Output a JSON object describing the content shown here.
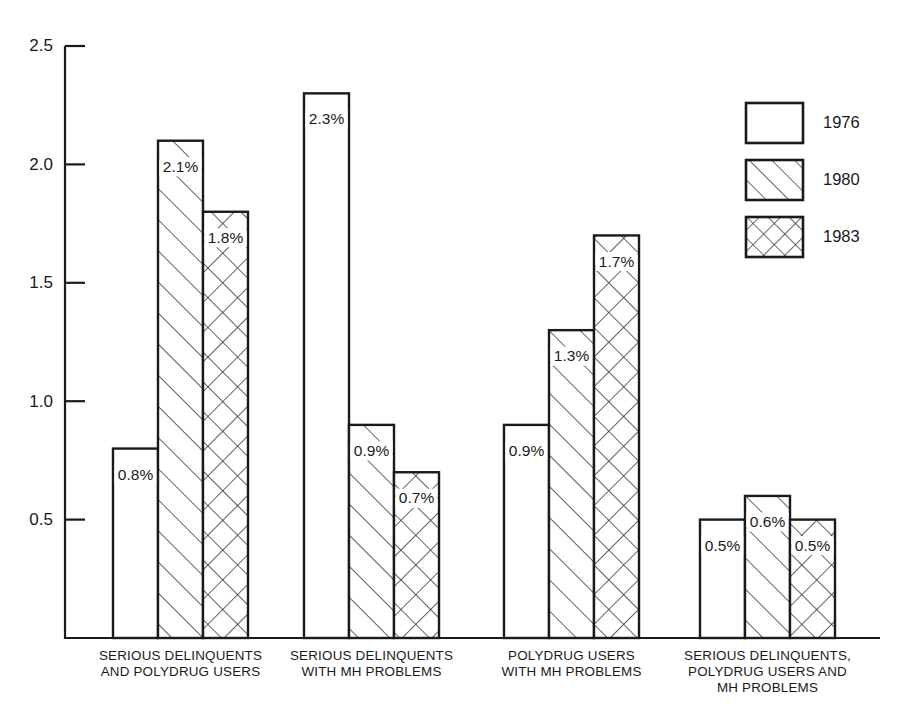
{
  "chart_data": {
    "type": "bar",
    "title": "",
    "subtitle": "",
    "xlabel": "",
    "ylabel": "",
    "ylim": [
      0,
      2.5
    ],
    "grid": false,
    "legend_position": "top-right",
    "y_ticks": [
      "0.5",
      "1.0",
      "1.5",
      "2.0",
      "2.5"
    ],
    "y_tick_values": [
      0.5,
      1.0,
      1.5,
      2.0,
      2.5
    ],
    "categories": [
      "SERIOUS DELINQUENTS AND POLYDRUG USERS",
      "SERIOUS DELINQUENTS WITH MH PROBLEMS",
      "POLYDRUG USERS WITH MH PROBLEMS",
      "SERIOUS DELINQUENTS, POLYDRUG USERS AND MH PROBLEMS"
    ],
    "category_lines": [
      [
        "SERIOUS DELINQUENTS",
        "AND POLYDRUG USERS"
      ],
      [
        "SERIOUS DELINQUENTS",
        "WITH MH PROBLEMS"
      ],
      [
        "POLYDRUG USERS",
        "WITH MH PROBLEMS"
      ],
      [
        "SERIOUS DELINQUENTS,",
        "POLYDRUG USERS AND",
        "MH PROBLEMS"
      ]
    ],
    "series": [
      {
        "name": "1976",
        "pattern": "plain",
        "values": [
          0.8,
          2.3,
          0.9,
          0.5
        ],
        "labels": [
          "0.8%",
          "2.3%",
          "0.9%",
          "0.5%"
        ]
      },
      {
        "name": "1980",
        "pattern": "diagonal",
        "values": [
          2.1,
          0.9,
          1.3,
          0.6
        ],
        "labels": [
          "2.1%",
          "0.9%",
          "1.3%",
          "0.6%"
        ]
      },
      {
        "name": "1983",
        "pattern": "crosshatch",
        "values": [
          1.8,
          0.7,
          1.7,
          0.5
        ],
        "labels": [
          "1.8%",
          "0.7%",
          "1.7%",
          "0.5%"
        ]
      }
    ]
  },
  "legend": {
    "entries": [
      {
        "label": "1976",
        "pattern": "plain"
      },
      {
        "label": "1980",
        "pattern": "diagonal"
      },
      {
        "label": "1983",
        "pattern": "crosshatch"
      }
    ]
  },
  "colors": {
    "ink": "#1a1a1a",
    "background": "#ffffff",
    "hatch": "#3a3a3a"
  }
}
